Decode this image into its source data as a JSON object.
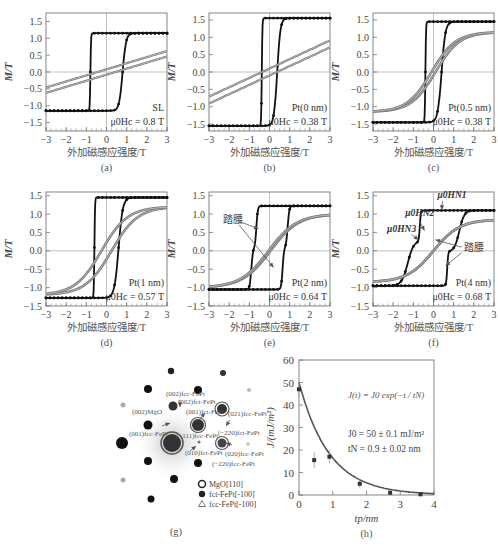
{
  "figure": {
    "x_axis_label": "外加磁感应强度/T",
    "y_axis_label": "M/T"
  },
  "chart_data": [
    {
      "id": "a",
      "type": "line",
      "caption": "(a)",
      "xlabel": "外加磁感应强度/T",
      "ylabel": "M/T",
      "xlim": [
        -3,
        3
      ],
      "ylim": [
        -1.75,
        1.75
      ],
      "xticks": [
        -3,
        -2,
        -1,
        0,
        1,
        2,
        3
      ],
      "yticks": [
        -1.5,
        -1.0,
        -0.5,
        0.0,
        0.5,
        1.0,
        1.5
      ],
      "ytick_labels": [
        "-1.5",
        "-1.0",
        "-0.5",
        "0.0",
        "0.5",
        "1.0",
        "1.5"
      ],
      "annotations": [
        "SL",
        "μ0Hc = 0.8 T"
      ],
      "sample_label": "SL",
      "coercivity_label": "μ0Hc = 0.8 T",
      "series": [
        {
          "name": "hard-loop",
          "color": "#111111",
          "Ms": 1.15,
          "Hc": 0.8,
          "sharp_side": "up",
          "width": 0.08
        },
        {
          "name": "soft-loop",
          "color": "#7a7a7a",
          "slope": 0.18,
          "offset": 0.08,
          "kind": "linear"
        }
      ]
    },
    {
      "id": "b",
      "type": "line",
      "caption": "(b)",
      "xlabel": "外加磁感应强度/T",
      "ylabel": "M/T",
      "xlim": [
        -3,
        3
      ],
      "ylim": [
        -1.7,
        1.7
      ],
      "xticks": [
        -3,
        -2,
        -1,
        0,
        1,
        2,
        3
      ],
      "yticks": [
        -1.5,
        -1.0,
        -0.5,
        0.0,
        0.5,
        1.0,
        1.5
      ],
      "ytick_labels": [
        "-1.5",
        "-1.0",
        "-0.5",
        "0.0",
        "0.5",
        "1.0",
        "1.5"
      ],
      "sample_label": "Pt(0 nm)",
      "coercivity_label": "μ0Hc = 0.38 T",
      "series": [
        {
          "name": "hard-loop",
          "color": "#111111",
          "Ms": 1.55,
          "Hc": 0.38,
          "sharp_side": "up",
          "width": 0.07
        },
        {
          "name": "soft-loop",
          "color": "#7a7a7a",
          "slope": 0.27,
          "offset": 0.1,
          "kind": "linear"
        }
      ]
    },
    {
      "id": "c",
      "type": "line",
      "caption": "(c)",
      "xlabel": "外加磁感应强度/T",
      "ylabel": "M/T",
      "xlim": [
        -3,
        3
      ],
      "ylim": [
        -1.7,
        1.7
      ],
      "xticks": [
        -3,
        -2,
        -1,
        0,
        1,
        2,
        3
      ],
      "yticks": [
        -1.5,
        -1.0,
        -0.5,
        0.0,
        0.5,
        1.0,
        1.5
      ],
      "ytick_labels": [
        "-1.5",
        "-1.0",
        "-0.5",
        "0.0",
        "0.5",
        "1.0",
        "1.5"
      ],
      "sample_label": "Pt(0.5 nm)",
      "coercivity_label": "μ0Hc = 0.38 T",
      "series": [
        {
          "name": "hard-loop",
          "color": "#111111",
          "Ms": 1.45,
          "Hc": 0.4,
          "sharp_side": "up",
          "width": 0.1
        },
        {
          "name": "soft-loop",
          "color": "#7a7a7a",
          "Ms": 1.15,
          "Hc": 0.1,
          "kind": "tanh",
          "scale": 1.2
        }
      ]
    },
    {
      "id": "d",
      "type": "line",
      "caption": "(d)",
      "xlabel": "外加磁感应强度/T",
      "ylabel": "M/T",
      "xlim": [
        -3,
        3
      ],
      "ylim": [
        -1.5,
        1.6
      ],
      "xticks": [
        -3,
        -2,
        -1,
        0,
        1,
        2,
        3
      ],
      "yticks": [
        -1.5,
        -1.0,
        -0.5,
        0.0,
        0.5,
        1.0,
        1.5
      ],
      "ytick_labels": [
        "-1.5",
        "-1.0",
        "-0.5",
        "0.0",
        "0.5",
        "1.0",
        "1.5"
      ],
      "sample_label": "Pt(1 nm)",
      "coercivity_label": "μ0Hc = 0.57 T",
      "series": [
        {
          "name": "hard-loop",
          "color": "#111111",
          "Ms": 1.45,
          "Ms_neg": 1.28,
          "Hc": 0.6,
          "sharp_side": "up",
          "width": 0.12
        },
        {
          "name": "soft-loop",
          "color": "#7a7a7a",
          "Ms": 1.2,
          "Hc": 0.25,
          "kind": "tanh",
          "scale": 1.3
        }
      ]
    },
    {
      "id": "e",
      "type": "line",
      "caption": "(e)",
      "xlabel": "外加磁感应强度/T",
      "ylabel": "M/T",
      "xlim": [
        -3,
        3
      ],
      "ylim": [
        -1.5,
        1.6
      ],
      "xticks": [
        -3,
        -2,
        -1,
        0,
        1,
        2,
        3
      ],
      "yticks": [
        -1.5,
        -1.0,
        -0.5,
        0.0,
        0.5,
        1.0,
        1.5
      ],
      "ytick_labels": [
        "-1.5",
        "-1.0",
        "-0.5",
        "0.0",
        "0.5",
        "1.0",
        "1.5"
      ],
      "sample_label": "Pt(2 nm)",
      "coercivity_label": "μ0Hc = 0.64 T",
      "callout": "踏腰",
      "series": [
        {
          "name": "hard-loop",
          "color": "#111111",
          "Ms": 1.22,
          "Ms_neg": 1.05,
          "Hc": 0.65,
          "sharp_side": "step",
          "width": 0.15
        },
        {
          "name": "soft-loop",
          "color": "#7a7a7a",
          "Ms": 1.0,
          "Hc": 0.05,
          "kind": "tanh",
          "scale": 1.4
        }
      ]
    },
    {
      "id": "f",
      "type": "line",
      "caption": "(f)",
      "xlabel": "外加磁感应强度/T",
      "ylabel": "M/T",
      "xlim": [
        -3,
        3
      ],
      "ylim": [
        -1.5,
        1.6
      ],
      "xticks": [
        -3,
        -2,
        -1,
        0,
        1,
        2,
        3
      ],
      "yticks": [
        -1.5,
        -1.0,
        -0.5,
        0.0,
        0.5,
        1.0,
        1.5
      ],
      "ytick_labels": [
        "-1.5",
        "-1.0",
        "-0.5",
        "0.0",
        "0.5",
        "1.0",
        "1.5"
      ],
      "sample_label": "Pt(4 nm)",
      "coercivity_label": "μ0Hc = 0.68 T",
      "callout": "踏腰",
      "switching_fields": [
        "μ0HN1",
        "μ0HN2",
        "μ0HN3"
      ],
      "series": [
        {
          "name": "hard-loop",
          "color": "#111111",
          "Ms": 1.1,
          "Ms_neg": 0.95,
          "Hc": 0.68,
          "sharp_side": "multistep",
          "width": 0.15
        },
        {
          "name": "soft-loop",
          "color": "#7a7a7a",
          "Ms": 0.85,
          "Hc": 0.0,
          "kind": "tanh",
          "scale": 1.3
        }
      ]
    },
    {
      "id": "h",
      "type": "scatter",
      "caption": "(h)",
      "xlabel": "tp/nm",
      "ylabel": "J/(mJ/m²)",
      "xlim": [
        0,
        4
      ],
      "ylim": [
        0,
        60
      ],
      "xticks": [
        0,
        1,
        2,
        3,
        4
      ],
      "yticks": [
        0,
        10,
        20,
        30,
        40,
        50,
        60
      ],
      "formula": "J(t) = J0 exp(−t / tN)",
      "fit_params": [
        "J0 = 50 ± 0.1 mJ/m²",
        "tN = 0.9 ± 0.02 nm"
      ],
      "fit": {
        "J0": 50,
        "tN": 0.9
      },
      "points": [
        {
          "x": 0.0,
          "y": 47,
          "err": 3
        },
        {
          "x": 0.45,
          "y": 15.5,
          "err": 3.5
        },
        {
          "x": 0.9,
          "y": 17,
          "err": 3
        },
        {
          "x": 1.8,
          "y": 5,
          "err": 2
        },
        {
          "x": 2.7,
          "y": 1,
          "err": 1
        },
        {
          "x": 3.6,
          "y": 0.3,
          "err": 0.5
        }
      ]
    }
  ],
  "diffraction": {
    "caption": "(g)",
    "labels": [
      "(002)fcc-FePt",
      "(002)fct-FePt",
      "(002)MgO",
      "(001)fct-FePt",
      "(021)fcc-FePt",
      "(001)fcc-FePt",
      "(−111)fcc-FePt",
      "(−220)fct-FePt",
      "(010)fct-FePt",
      "(020)fcc-FePt",
      "(−220)fcc-FePt"
    ],
    "legend": [
      {
        "symbol": "open-circle",
        "label": "MgO[110]"
      },
      {
        "symbol": "filled-circle",
        "label": "fct-FePt[-100]"
      },
      {
        "symbol": "triangle",
        "label": "fcc-FePt[-100]"
      }
    ]
  },
  "axis_labels": {
    "mu0H_x": "外加磁感应强度/T",
    "M": "M/T",
    "tp": "tp/nm",
    "J": "J/(mJ/m²)"
  }
}
